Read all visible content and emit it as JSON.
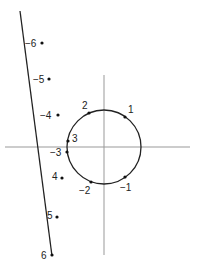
{
  "diagram": {
    "axes": {
      "horizontal": {
        "x1": 5,
        "y1": 147,
        "x2": 190,
        "y2": 147
      },
      "vertical": {
        "x1": 104,
        "y1": 75,
        "x2": 104,
        "y2": 255
      },
      "color": "#999999"
    },
    "circle": {
      "cx": 104,
      "cy": 147,
      "r": 37,
      "color": "#222222"
    },
    "line": {
      "x1": 20,
      "y1": 11,
      "x2": 52,
      "y2": 256,
      "color": "#222222"
    },
    "circle_points": [
      {
        "label": "1",
        "x": 125,
        "y": 117,
        "lx": 128,
        "ly": 113
      },
      {
        "label": "2",
        "x": 89,
        "y": 113,
        "lx": 82,
        "ly": 109
      },
      {
        "label": "3",
        "x": 68,
        "y": 141,
        "lx": 72,
        "ly": 142
      },
      {
        "label": "-1",
        "x": 125,
        "y": 177,
        "lx": 120,
        "ly": 191
      },
      {
        "label": "-2",
        "x": 91,
        "y": 182,
        "lx": 79,
        "ly": 194
      }
    ],
    "line_points": [
      {
        "label": "-6",
        "x": 42,
        "y": 43,
        "lx": 25,
        "ly": 47
      },
      {
        "label": "-5",
        "x": 49,
        "y": 79,
        "lx": 33,
        "ly": 83
      },
      {
        "label": "-4",
        "x": 58,
        "y": 115,
        "lx": 40,
        "ly": 119
      },
      {
        "label": "-3",
        "x": 67,
        "y": 152,
        "lx": 50,
        "ly": 156
      },
      {
        "label": "4",
        "x": 62,
        "y": 178,
        "lx": 52,
        "ly": 180
      },
      {
        "label": "5",
        "x": 57,
        "y": 217,
        "lx": 47,
        "ly": 219
      },
      {
        "label": "6",
        "x": 52,
        "y": 255,
        "lx": 41,
        "ly": 259
      }
    ]
  }
}
